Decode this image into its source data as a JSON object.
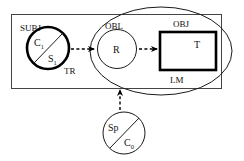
{
  "figure": {
    "type": "semiotic-diagram",
    "background": "#ffffff",
    "ink_color": "#111111"
  },
  "regions": {
    "outer_frame": {
      "name": "SUBJ",
      "label": "SUBJ",
      "shape": "rectangle"
    },
    "ellipse": {
      "name": "OBL",
      "label": "OBL",
      "shape": "ellipse"
    },
    "object_box": {
      "name": "OBJ",
      "label": "OBJ",
      "shape": "rectangle",
      "stroke": "bold"
    }
  },
  "nodes": {
    "subject_circle": {
      "shape": "circle-split",
      "stroke": "bold",
      "upper_label": "C",
      "upper_sub": "1",
      "lower_label": "S",
      "lower_sub": "1"
    },
    "relation_circle": {
      "shape": "circle",
      "stroke": "thin",
      "label": "R"
    },
    "term_box": {
      "shape": "rectangle",
      "stroke": "bold",
      "label": "T"
    },
    "speaker_circle": {
      "shape": "circle-split",
      "stroke": "thin",
      "upper_label": "Sp",
      "lower_label": "C",
      "lower_sub": "0"
    }
  },
  "edge_labels": {
    "tr": "TR",
    "lm": "LM"
  },
  "arrows": [
    {
      "name": "subject-to-relation",
      "style": "dashed",
      "direction": "right"
    },
    {
      "name": "relation-to-term",
      "style": "dashed",
      "direction": "right"
    },
    {
      "name": "speaker-to-oblique",
      "style": "dashed",
      "direction": "up"
    }
  ]
}
